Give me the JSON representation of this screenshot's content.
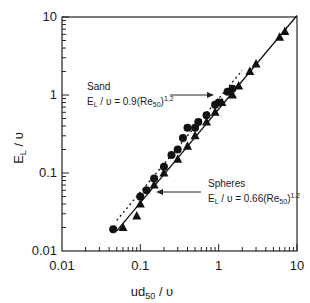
{
  "chart_data": {
    "type": "scatter",
    "title": "",
    "xlabel": "ud50 / υ",
    "ylabel": "EL / υ",
    "xscale": "log",
    "yscale": "log",
    "xlim": [
      0.01,
      10
    ],
    "ylim": [
      0.01,
      10
    ],
    "x_ticks": [
      "0.01",
      "0.1",
      "1",
      "10"
    ],
    "y_ticks": [
      "0.01",
      "0.1",
      "1",
      "10"
    ],
    "grid": false,
    "legend": "none (inline annotations)",
    "series": [
      {
        "name": "Sand",
        "marker": "circle",
        "points": [
          [
            0.045,
            0.019
          ],
          [
            0.1,
            0.05
          ],
          [
            0.12,
            0.06
          ],
          [
            0.15,
            0.085
          ],
          [
            0.2,
            0.12
          ],
          [
            0.25,
            0.17
          ],
          [
            0.3,
            0.2
          ],
          [
            0.35,
            0.28
          ],
          [
            0.4,
            0.38
          ],
          [
            0.5,
            0.38
          ],
          [
            0.55,
            0.45
          ],
          [
            0.7,
            0.55
          ],
          [
            0.9,
            0.75
          ],
          [
            1.0,
            0.8
          ],
          [
            1.3,
            1.1
          ],
          [
            1.5,
            1.2
          ]
        ],
        "fit": {
          "label": "EL / υ = 0.9(Re50)^1.2",
          "coef": 0.9,
          "exp": 1.2,
          "style": "dotted",
          "x_range": [
            0.05,
            2.0
          ]
        }
      },
      {
        "name": "Spheres",
        "marker": "triangle",
        "points": [
          [
            0.06,
            0.02
          ],
          [
            0.09,
            0.028
          ],
          [
            0.1,
            0.04
          ],
          [
            0.15,
            0.07
          ],
          [
            0.2,
            0.1
          ],
          [
            0.3,
            0.15
          ],
          [
            0.4,
            0.22
          ],
          [
            0.5,
            0.3
          ],
          [
            0.7,
            0.45
          ],
          [
            0.9,
            0.6
          ],
          [
            1.1,
            0.8
          ],
          [
            1.5,
            1.0
          ],
          [
            1.8,
            1.3
          ],
          [
            2.5,
            2.0
          ],
          [
            3.0,
            2.5
          ],
          [
            6.0,
            5.5
          ],
          [
            7.0,
            6.5
          ]
        ],
        "fit": {
          "label": "EL / υ = 0.66(Re50)^1.2",
          "coef": 0.66,
          "exp": 1.2,
          "style": "solid",
          "x_range": [
            0.05,
            10
          ]
        }
      }
    ],
    "annotations": [
      {
        "title": "Sand",
        "equation": "EL / υ = 0.9(Re50)^1.2",
        "arrow_to": [
          1.0,
          0.75
        ]
      },
      {
        "title": "Spheres",
        "equation": "EL / υ = 0.66(Re50)^1.2",
        "arrow_to": [
          0.15,
          0.08
        ]
      }
    ]
  },
  "labels": {
    "y_axis": {
      "main": "E",
      "sub": "L",
      "rest": " / υ"
    },
    "x_axis": {
      "main": "ud",
      "sub": "50",
      "rest": " / υ"
    },
    "sand": {
      "title": "Sand",
      "eq_pre": "E",
      "eq_sub": "L",
      "eq_mid": " / υ = 0.9(Re",
      "eq_sub2": "50",
      "eq_post": ")",
      "eq_exp": "1.2"
    },
    "spheres": {
      "title": "Spheres",
      "eq_pre": "E",
      "eq_sub": "L",
      "eq_mid": " / υ = 0.66(Re",
      "eq_sub2": "50",
      "eq_post": ")",
      "eq_exp": "1.2"
    }
  }
}
